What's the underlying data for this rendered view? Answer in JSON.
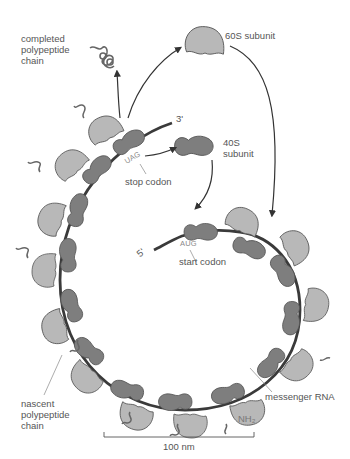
{
  "diagram": {
    "labels": {
      "completed_chain": "completed\npolypeptide\nchain",
      "subunit_60s": "60S subunit",
      "subunit_40s": "40S\nsubunit",
      "three_prime": "3'",
      "five_prime": "5'",
      "stop_codon": "stop codon",
      "stop_codon_seq": "UAG",
      "start_codon": "start codon",
      "start_codon_seq": "AUG",
      "nascent_chain": "nascent\npolypeptide\nchain",
      "mrna": "messenger RNA",
      "nh2": "NH₂",
      "scale_bar": "100 nm"
    },
    "colors": {
      "large_subunit": "#b8b8b8",
      "small_subunit": "#7e7e7e",
      "mrna": "#3a3a3a",
      "text": "#555555",
      "outline": "#4a4a4a"
    }
  }
}
